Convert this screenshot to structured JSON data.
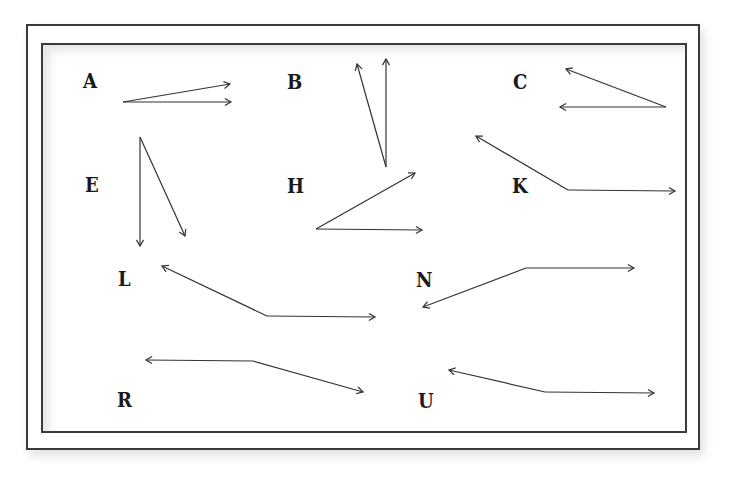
{
  "diagram": {
    "style": {
      "line_color": "#333333",
      "frame_color": "#3a3a3a",
      "background": "#ffffff"
    },
    "figures": [
      {
        "label": "A",
        "label_pos": [
          83,
          72
        ],
        "vertex": [
          123,
          102
        ],
        "rays": [
          [
            230,
            84
          ],
          [
            231,
            102
          ]
        ]
      },
      {
        "label": "B",
        "label_pos": [
          287,
          73
        ],
        "vertex": [
          386,
          167
        ],
        "rays": [
          [
            357,
            64
          ],
          [
            386,
            59
          ]
        ]
      },
      {
        "label": "C",
        "label_pos": [
          513,
          73
        ],
        "vertex": [
          666,
          107
        ],
        "rays": [
          [
            566,
            69
          ],
          [
            560,
            107
          ]
        ]
      },
      {
        "label": "E",
        "label_pos": [
          85,
          176
        ],
        "vertex": [
          140,
          137
        ],
        "rays": [
          [
            140,
            246
          ],
          [
            185,
            236
          ]
        ]
      },
      {
        "label": "H",
        "label_pos": [
          287,
          177
        ],
        "vertex": [
          316,
          229
        ],
        "rays": [
          [
            415,
            173
          ],
          [
            422,
            230
          ]
        ]
      },
      {
        "label": "K",
        "label_pos": [
          512,
          177
        ],
        "vertex": [
          568,
          190
        ],
        "rays": [
          [
            476,
            136
          ],
          [
            675,
            191
          ]
        ]
      },
      {
        "label": "L",
        "label_pos": [
          118,
          270
        ],
        "vertex": [
          267,
          316
        ],
        "rays": [
          [
            162,
            266
          ],
          [
            375,
            317
          ]
        ]
      },
      {
        "label": "N",
        "label_pos": [
          416,
          271
        ],
        "vertex": [
          526,
          268
        ],
        "rays": [
          [
            423,
            307
          ],
          [
            634,
            268
          ]
        ]
      },
      {
        "label": "R",
        "label_pos": [
          117,
          391
        ],
        "vertex": [
          253,
          361
        ],
        "rays": [
          [
            146,
            360
          ],
          [
            363,
            392
          ]
        ]
      },
      {
        "label": "U",
        "label_pos": [
          418,
          392
        ],
        "vertex": [
          545,
          392
        ],
        "rays": [
          [
            449,
            370
          ],
          [
            654,
            393
          ]
        ]
      }
    ]
  }
}
